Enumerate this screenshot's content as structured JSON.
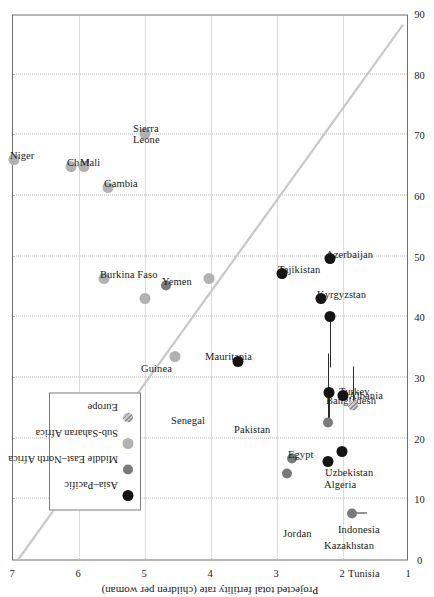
{
  "chart_data": {
    "type": "scatter",
    "title": "",
    "xlabel": "Percentage of population living below the poverty line",
    "ylabel": "Projected total fertility rate (children per woman)",
    "xlim": [
      0,
      90
    ],
    "ylim": [
      1,
      7
    ],
    "xticks": [
      "0",
      "10",
      "20",
      "30",
      "40",
      "50",
      "60",
      "70",
      "80",
      "90"
    ],
    "yticks": [
      "1",
      "2",
      "3",
      "4",
      "5",
      "6",
      "7"
    ],
    "grid": "dotted both axes",
    "legend_position": "lower-left inside plot",
    "trendline": {
      "present": true,
      "color": "#c8c8c8",
      "x0": 0,
      "y0": 6.92,
      "x1": 88.5,
      "y1": 1.06
    },
    "legend": [
      {
        "label": "Asia–Pacific",
        "marker": "filled-circle",
        "color": "#141414",
        "key": "asia"
      },
      {
        "label": "Middle East–North Africa",
        "marker": "filled-circle",
        "color": "#7b7b7b",
        "key": "mena"
      },
      {
        "label": "Sub-Saharan Africa",
        "marker": "filled-circle",
        "color": "#b2b2b2",
        "key": "ssa"
      },
      {
        "label": "Europe",
        "marker": "hatched-circle",
        "color": "#c9c9c9",
        "key": "eur"
      }
    ],
    "points": [
      {
        "label": "Niger",
        "group": "ssa",
        "x": 65.9,
        "y": 6.99,
        "lx": 10,
        "ly": -4,
        "lines": 1
      },
      {
        "label": "Chad",
        "group": "ssa",
        "x": 64.8,
        "y": 6.12,
        "lx": 10,
        "ly": -4,
        "lines": 1
      },
      {
        "label": "Mali",
        "group": "ssa",
        "x": 64.8,
        "y": 5.92,
        "lx": 10,
        "ly": -4,
        "lines": 1
      },
      {
        "label": "Sierra Leone",
        "group": "ssa",
        "x": 70.2,
        "y": 5.0,
        "lx": 10,
        "ly": -12,
        "lines": 2
      },
      {
        "label": "Gambia",
        "group": "ssa",
        "x": 61.3,
        "y": 5.56,
        "lx": 10,
        "ly": -4,
        "lines": 1
      },
      {
        "label": "Burkina Faso",
        "group": "ssa",
        "x": 46.4,
        "y": 5.62,
        "lx": 10,
        "ly": -4,
        "lines": 1
      },
      {
        "label": "Guinea",
        "group": "ssa",
        "x": 43.0,
        "y": 5.0,
        "lx": -64,
        "ly": -4,
        "lines": 1
      },
      {
        "label": "Yemen",
        "group": "mena",
        "x": 45.2,
        "y": 4.68,
        "lx": 10,
        "ly": -4,
        "lines": 1
      },
      {
        "label": "Mauritania",
        "group": "ssa",
        "x": 46.4,
        "y": 4.03,
        "lx": -72,
        "ly": -4,
        "lines": 1
      },
      {
        "label": "Senegal",
        "group": "ssa",
        "x": 33.5,
        "y": 4.54,
        "lx": -58,
        "ly": -4,
        "lines": 1
      },
      {
        "label": "Pakistan",
        "group": "asia",
        "x": 32.6,
        "y": 3.59,
        "lx": -62,
        "ly": -4,
        "lines": 1
      },
      {
        "label": "Tajikistan",
        "group": "asia",
        "x": 47.2,
        "y": 2.93,
        "lx": 10,
        "ly": -4,
        "lines": 1
      },
      {
        "label": "Kyrgyzstan",
        "group": "asia",
        "x": 43.1,
        "y": 2.34,
        "lx": 10,
        "ly": -4,
        "lines": 1
      },
      {
        "label": "Azerbaijan",
        "group": "asia",
        "x": 49.6,
        "y": 2.19,
        "lx": 10,
        "ly": -4,
        "lines": 1
      },
      {
        "label": "Bangladesh",
        "group": "asia",
        "x": 40.0,
        "y": 2.2,
        "lx": -78,
        "ly": -4,
        "lines": 1
      },
      {
        "label": "Uzbekistan",
        "group": "asia",
        "x": 27.5,
        "y": 2.21,
        "lx": -74,
        "ly": -4,
        "lines": 1
      },
      {
        "label": "Turkey",
        "group": "asia",
        "x": 27.0,
        "y": 2.0,
        "lx": 10,
        "ly": -4,
        "lines": 1
      },
      {
        "label": "Albania",
        "group": "eur",
        "x": 25.4,
        "y": 1.85,
        "lx": 16,
        "ly": -4,
        "lines": 1
      },
      {
        "label": "Algeria",
        "group": "mena",
        "x": 22.6,
        "y": 2.22,
        "lx": -56,
        "ly": -4,
        "lines": 1
      },
      {
        "label": "Egypt",
        "group": "mena",
        "x": 16.7,
        "y": 2.77,
        "lx": 10,
        "ly": -4,
        "lines": 1
      },
      {
        "label": "Jordan",
        "group": "mena",
        "x": 14.2,
        "y": 2.85,
        "lx": -54,
        "ly": -4,
        "lines": 1
      },
      {
        "label": "Kazakhstan",
        "group": "asia",
        "x": 16.1,
        "y": 2.22,
        "lx": -78,
        "ly": -4,
        "lines": 1
      },
      {
        "label": "Indonesia",
        "group": "asia",
        "x": 17.8,
        "y": 2.02,
        "lx": -72,
        "ly": -4,
        "lines": 1
      },
      {
        "label": "Tunisia",
        "group": "mena",
        "x": 7.6,
        "y": 1.87,
        "lx": -54,
        "ly": -4,
        "lines": 1
      }
    ],
    "leaders": [
      {
        "from_x": 40.0,
        "from_y": 2.2,
        "to_x": 31.6,
        "to_y": 2.2
      },
      {
        "from_x": 27.5,
        "from_y": 2.21,
        "to_x": 22.0,
        "to_y": 2.21
      },
      {
        "from_x": 22.6,
        "from_y": 2.22,
        "to_x": 34.0,
        "to_y": 2.22
      },
      {
        "from_x": 25.4,
        "from_y": 1.85,
        "to_x": 31.8,
        "to_y": 1.85
      },
      {
        "from_x": 7.6,
        "from_y": 1.87,
        "to_x": 7.6,
        "to_y": 1.64
      }
    ]
  }
}
